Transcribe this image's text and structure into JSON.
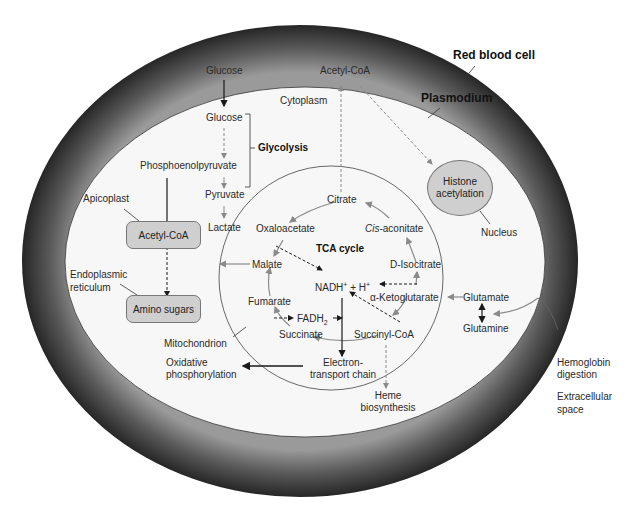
{
  "diagram": {
    "compartments": {
      "red_blood_cell": "Red blood cell",
      "plasmodium": "Plasmodium",
      "cytoplasm": "Cytoplasm",
      "apicoplast": "Apicoplast",
      "endoplasmic_reticulum_1": "Endoplasmic",
      "endoplasmic_reticulum_2": "reticulum",
      "mitochondrion": "Mitochondrion",
      "nucleus": "Nucleus",
      "extracellular_1": "Extracellular",
      "extracellular_2": "space"
    },
    "glycolysis": {
      "label": "Glycolysis",
      "glucose_external": "Glucose",
      "glucose": "Glucose",
      "pep": "Phosphoenolpyruvate",
      "pyruvate": "Pyruvate",
      "lactate": "Lactate"
    },
    "acetyl_coa_top": "Acetyl-CoA",
    "apicoplast_box": "Acetyl-CoA",
    "er_box": "Amino sugars",
    "histone": {
      "line1": "Histone",
      "line2": "acetylation"
    },
    "tca": {
      "label": "TCA cycle",
      "citrate": "Citrate",
      "oxaloacetate": "Oxaloacetate",
      "cis_aconitate_italic": "Cis",
      "cis_aconitate_rest": "-aconitate",
      "malate": "Malate",
      "isocitrate": "D-Isocitrate",
      "nadh": "NADH",
      "nadh_sup": "+",
      "nadh_rest": " + H",
      "h_sup": "+",
      "ketoglutarate": "α-Ketoglutarate",
      "fumarate": "Fumarate",
      "fadh": "FADH",
      "fadh_sub": "2",
      "succinate": "Succinate",
      "succinyl_coa": "Succinyl-CoA"
    },
    "etc": {
      "line1": "Electron-",
      "line2": "transport chain"
    },
    "oxphos": {
      "line1": "Oxidative",
      "line2": "phosphorylation"
    },
    "heme": {
      "line1": "Heme",
      "line2": "biosynthesis"
    },
    "glutamate": "Glutamate",
    "glutamine": "Glutamine",
    "hemoglobin": {
      "line1": "Hemoglobin",
      "line2": "digestion"
    },
    "colors": {
      "rbc_membrane_dark": "#2b2b2b",
      "rbc_membrane_light": "#8a8a8a",
      "plasmodium_fill": "#f7f7f7",
      "box_fill": "#cfcfcf",
      "arrow_black": "#1a1a1a",
      "arrow_gray": "#8a8a8a"
    }
  }
}
